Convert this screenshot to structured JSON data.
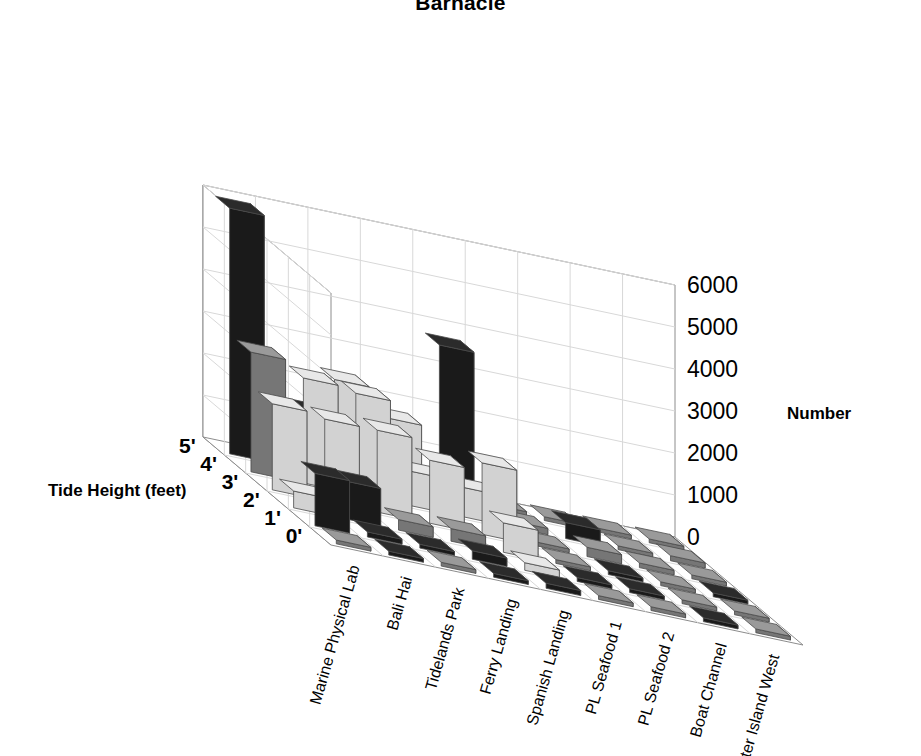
{
  "chart": {
    "title": "Barnacle",
    "z_axis_title": "Number",
    "y_axis_title": "Tide Height (feet)"
  },
  "chart_data": {
    "type": "bar",
    "title": "Barnacle",
    "xlabel": "",
    "ylabel": "Tide Height (feet)",
    "zlabel": "Number",
    "grid": true,
    "legend": "none",
    "projection": "3d-isometric",
    "zlim": [
      0,
      6000
    ],
    "z_ticks": [
      "0",
      "1000",
      "2000",
      "3000",
      "4000",
      "5000",
      "6000"
    ],
    "z_tick_values": [
      0,
      1000,
      2000,
      3000,
      4000,
      5000,
      6000
    ],
    "categories": [
      "Marine Physical Lab",
      "Bali Hai",
      "Tidelands Park",
      "Ferry Landing",
      "Spanish Landing",
      "PL Seafood 1",
      "PL Seafood 2",
      "Boat Channel",
      "Shelter Island West"
    ],
    "rows": [
      "5'",
      "4'",
      "3'",
      "2'",
      "1'",
      "0'"
    ],
    "series": [
      {
        "name": "5'",
        "values": [
          5850,
          1400,
          2300,
          1650,
          3650,
          120,
          60,
          40,
          30
        ]
      },
      {
        "name": "4'",
        "values": [
          2850,
          2500,
          2400,
          820,
          700,
          150,
          380,
          60,
          120
        ]
      },
      {
        "name": "3'",
        "values": [
          2050,
          1950,
          1950,
          1500,
          1700,
          90,
          220,
          110,
          60
        ]
      },
      {
        "name": "2'",
        "values": [
          400,
          900,
          250,
          300,
          700,
          60,
          40,
          50,
          40
        ]
      },
      {
        "name": "1'",
        "values": [
          1250,
          120,
          60,
          200,
          180,
          50,
          40,
          30,
          20
        ]
      },
      {
        "name": "0'",
        "values": [
          30,
          40,
          25,
          35,
          120,
          30,
          20,
          20,
          20
        ]
      }
    ],
    "shades": [
      [
        "dark",
        "dark",
        "light",
        "light",
        "dark",
        "mid",
        "mid",
        "mid",
        "mid"
      ],
      [
        "mid",
        "light",
        "light",
        "light",
        "light",
        "mid",
        "dark",
        "mid",
        "mid"
      ],
      [
        "light",
        "light",
        "light",
        "light",
        "light",
        "mid",
        "mid",
        "mid",
        "mid"
      ],
      [
        "light",
        "dark",
        "mid",
        "mid",
        "light",
        "mid",
        "dark",
        "mid",
        "dark"
      ],
      [
        "dark",
        "dark",
        "dark",
        "dark",
        "light",
        "dark",
        "dark",
        "mid",
        "mid"
      ],
      [
        "mid",
        "dark",
        "mid",
        "dark",
        "dark",
        "mid",
        "mid",
        "dark",
        "mid"
      ]
    ]
  },
  "colors": {
    "dark_top": "#2b2b2b",
    "dark_left": "#1a1a1a",
    "dark_right": "#3d3d3d",
    "mid_top": "#9a9a9a",
    "mid_left": "#767676",
    "mid_right": "#b0b0b0",
    "light_top": "#e8e8e8",
    "light_left": "#d2d2d2",
    "light_right": "#fbfbfb",
    "axis": "#8c8c8c",
    "grid": "#d8d8d8",
    "outline": "#4a4a4a",
    "background": "#ffffff"
  }
}
